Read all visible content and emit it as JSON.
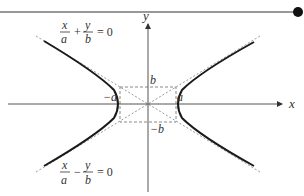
{
  "figure": {
    "title_rule": {
      "color": "#333333",
      "end_dot_color": "#111111"
    },
    "axes": {
      "x_label": "x",
      "y_label": "y",
      "color": "#555555"
    },
    "rectangle": {
      "style": "dashed",
      "color": "#888888"
    },
    "labels": {
      "b": "b",
      "neg_b": "−b",
      "a": "a",
      "neg_a": "−a"
    },
    "hyperbola": {
      "color": "#1a1a1a"
    },
    "asymptotes": {
      "color": "#999999",
      "style": "dotted",
      "top_equation": {
        "num1": "x",
        "den1": "a",
        "op": "+",
        "num2": "y",
        "den2": "b",
        "rhs": "= 0"
      },
      "bottom_equation": {
        "num1": "x",
        "den1": "a",
        "op": "−",
        "num2": "y",
        "den2": "b",
        "rhs": "= 0"
      }
    }
  }
}
